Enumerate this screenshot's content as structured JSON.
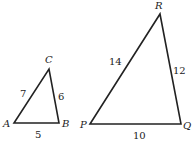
{
  "triangles": [
    {
      "name": "ABC",
      "vertices": {
        "A": "A",
        "B": "B",
        "C": "C"
      },
      "sides": {
        "AB": "5",
        "BC": "6",
        "CA": "7"
      }
    },
    {
      "name": "PQR",
      "vertices": {
        "P": "P",
        "Q": "Q",
        "R": "R"
      },
      "sides": {
        "PQ": "10",
        "QR": "12",
        "RP": "14"
      }
    }
  ],
  "colors": {
    "stroke": "#222222",
    "background": "#ffffff"
  }
}
